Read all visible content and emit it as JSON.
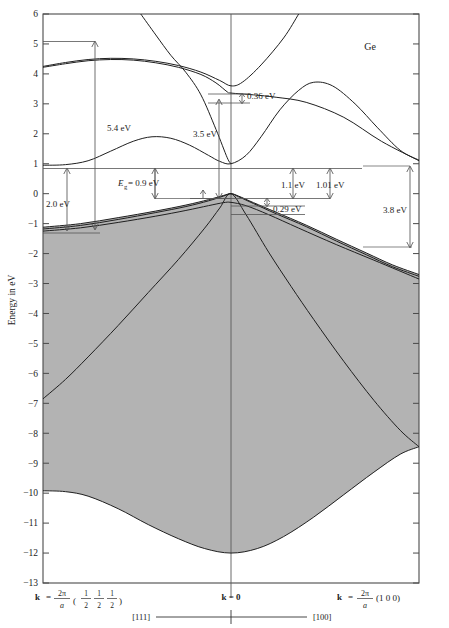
{
  "figure": {
    "material_label": "Ge",
    "y_axis_title": "Energy in eV",
    "y_ticks": [
      "6",
      "5",
      "4",
      "3",
      "2",
      "1",
      "0",
      "−1",
      "−2",
      "−3",
      "−4",
      "−5",
      "−6",
      "−7",
      "−8",
      "−9",
      "−10",
      "−11",
      "−12",
      "−13"
    ],
    "k_left_label_k": "k",
    "k_left_label_eq": "=",
    "k_left_num": "2π",
    "k_left_den": "a",
    "k_left_paren_open": "(",
    "k_left_paren_close": ")",
    "k_left_fracs": [
      {
        "num": "1",
        "den": "2"
      },
      {
        "num": "1",
        "den": "2"
      },
      {
        "num": "1",
        "den": "2"
      }
    ],
    "k_center_label": "k = 0",
    "k_right_label_k": "k",
    "k_right_label_eq": "=",
    "k_right_num": "2π",
    "k_right_den": "a",
    "k_right_tail": "(1 0 0)",
    "direction_left": "[111]",
    "direction_right": "[100]"
  },
  "annotations": [
    {
      "id": "gap-5p4",
      "label": "5.4 eV"
    },
    {
      "id": "gap-2p0",
      "label": "2.0 eV"
    },
    {
      "id": "gap-eg",
      "label_italic": "E",
      "label_sub": "g",
      "label_rest": " = 0.9 eV"
    },
    {
      "id": "gap-3p5",
      "label": "3.5 eV"
    },
    {
      "id": "gap-0p36",
      "label": "0.36 eV"
    },
    {
      "id": "gap-1p1",
      "label": "1.1 eV"
    },
    {
      "id": "gap-1p01",
      "label": "1.01 eV"
    },
    {
      "id": "gap-0p29",
      "label": "0.29 eV"
    },
    {
      "id": "gap-3p8",
      "label": "3.8 eV"
    }
  ],
  "chart_data": {
    "type": "line",
    "xlabel": "k",
    "ylabel": "Energy in eV",
    "ylim": [
      -13,
      6
    ],
    "xlim": [
      0,
      1
    ],
    "grid": false,
    "legend": "none",
    "x_tick_labels": [
      "k = 2π/a (1/2 1/2 1/2)",
      "k = 0",
      "k = 2π/a (1 0 0)"
    ],
    "x_tick_positions": [
      0,
      0.5,
      1
    ],
    "direction_segments": [
      "[111]",
      "[100]"
    ],
    "shaded_region": "valence bands (filled states) shaded grey",
    "series": [
      {
        "name": "upper conduction band (L2' - Gamma15 - X)",
        "points": [
          [
            0.0,
            4.25
          ],
          [
            0.06,
            4.38
          ],
          [
            0.12,
            4.48
          ],
          [
            0.18,
            4.52
          ],
          [
            0.24,
            4.5
          ],
          [
            0.3,
            4.42
          ],
          [
            0.36,
            4.28
          ],
          [
            0.42,
            4.06
          ],
          [
            0.47,
            3.78
          ],
          [
            0.5,
            3.6
          ],
          [
            0.53,
            3.72
          ],
          [
            0.58,
            4.3
          ],
          [
            0.64,
            5.2
          ],
          [
            0.68,
            6.0
          ]
        ]
      },
      {
        "name": "upper conduction band 2 (split)",
        "points": [
          [
            0.0,
            4.22
          ],
          [
            0.06,
            4.34
          ],
          [
            0.12,
            4.44
          ],
          [
            0.18,
            4.48
          ],
          [
            0.24,
            4.46
          ],
          [
            0.3,
            4.37
          ],
          [
            0.36,
            4.22
          ],
          [
            0.42,
            3.98
          ],
          [
            0.46,
            3.7
          ],
          [
            0.49,
            3.4
          ],
          [
            0.5,
            3.36
          ],
          [
            0.56,
            3.3
          ],
          [
            0.62,
            3.22
          ],
          [
            0.7,
            3.05
          ],
          [
            0.8,
            2.55
          ],
          [
            0.9,
            1.75
          ],
          [
            1.0,
            1.1
          ]
        ]
      },
      {
        "name": "steep band descending to Gamma2'",
        "points": [
          [
            0.26,
            6.0
          ],
          [
            0.3,
            5.3
          ],
          [
            0.34,
            4.62
          ],
          [
            0.38,
            4.05
          ],
          [
            0.42,
            3.3
          ],
          [
            0.46,
            2.15
          ],
          [
            0.49,
            1.2
          ],
          [
            0.5,
            1.0
          ]
        ]
      },
      {
        "name": "lowest conduction band L1 - Gamma2' - X1",
        "points": [
          [
            0.0,
            0.95
          ],
          [
            0.06,
            0.97
          ],
          [
            0.12,
            1.1
          ],
          [
            0.18,
            1.42
          ],
          [
            0.24,
            1.75
          ],
          [
            0.29,
            1.9
          ],
          [
            0.34,
            1.85
          ],
          [
            0.39,
            1.62
          ],
          [
            0.44,
            1.28
          ],
          [
            0.47,
            1.08
          ],
          [
            0.5,
            1.0
          ],
          [
            0.54,
            1.28
          ],
          [
            0.58,
            1.9
          ],
          [
            0.63,
            2.8
          ],
          [
            0.68,
            3.45
          ],
          [
            0.72,
            3.72
          ],
          [
            0.77,
            3.6
          ],
          [
            0.83,
            3.0
          ],
          [
            0.89,
            2.2
          ],
          [
            0.95,
            1.45
          ],
          [
            1.0,
            1.12
          ]
        ]
      },
      {
        "name": "light hole valence band",
        "points": [
          [
            0.0,
            -1.12
          ],
          [
            0.1,
            -1.0
          ],
          [
            0.2,
            -0.8
          ],
          [
            0.3,
            -0.58
          ],
          [
            0.38,
            -0.38
          ],
          [
            0.44,
            -0.2
          ],
          [
            0.48,
            -0.06
          ],
          [
            0.5,
            0.0
          ],
          [
            0.52,
            -0.08
          ],
          [
            0.56,
            -0.3
          ],
          [
            0.62,
            -0.62
          ],
          [
            0.7,
            -1.05
          ],
          [
            0.78,
            -1.52
          ],
          [
            0.86,
            -1.98
          ],
          [
            0.93,
            -2.38
          ],
          [
            1.0,
            -2.7
          ]
        ]
      },
      {
        "name": "heavy hole valence band",
        "points": [
          [
            0.0,
            -1.18
          ],
          [
            0.1,
            -1.06
          ],
          [
            0.2,
            -0.86
          ],
          [
            0.3,
            -0.63
          ],
          [
            0.38,
            -0.43
          ],
          [
            0.44,
            -0.24
          ],
          [
            0.48,
            -0.08
          ],
          [
            0.5,
            0.0
          ],
          [
            0.52,
            -0.1
          ],
          [
            0.56,
            -0.33
          ],
          [
            0.62,
            -0.67
          ],
          [
            0.7,
            -1.1
          ],
          [
            0.78,
            -1.58
          ],
          [
            0.86,
            -2.04
          ],
          [
            0.93,
            -2.44
          ],
          [
            1.0,
            -2.76
          ]
        ]
      },
      {
        "name": "split-off valence band",
        "points": [
          [
            0.0,
            -1.25
          ],
          [
            0.1,
            -1.14
          ],
          [
            0.2,
            -0.96
          ],
          [
            0.3,
            -0.75
          ],
          [
            0.38,
            -0.56
          ],
          [
            0.44,
            -0.4
          ],
          [
            0.48,
            -0.3
          ],
          [
            0.5,
            -0.29
          ],
          [
            0.54,
            -0.4
          ],
          [
            0.6,
            -0.7
          ],
          [
            0.68,
            -1.15
          ],
          [
            0.78,
            -1.7
          ],
          [
            0.88,
            -2.22
          ],
          [
            1.0,
            -2.85
          ]
        ]
      },
      {
        "name": "second valence band (L1 - Gamma25' - X4)",
        "points": [
          [
            0.0,
            -6.85
          ],
          [
            0.06,
            -6.2
          ],
          [
            0.12,
            -5.45
          ],
          [
            0.2,
            -4.4
          ],
          [
            0.28,
            -3.3
          ],
          [
            0.36,
            -2.2
          ],
          [
            0.43,
            -1.15
          ],
          [
            0.47,
            -0.48
          ],
          [
            0.5,
            0.0
          ],
          [
            0.54,
            -0.7
          ],
          [
            0.6,
            -1.95
          ],
          [
            0.66,
            -3.1
          ],
          [
            0.72,
            -4.2
          ],
          [
            0.8,
            -5.6
          ],
          [
            0.88,
            -6.9
          ],
          [
            0.95,
            -7.9
          ],
          [
            1.0,
            -8.45
          ]
        ]
      },
      {
        "name": "lowest valence band L1 - Gamma1 - X1",
        "points": [
          [
            0.0,
            -9.92
          ],
          [
            0.06,
            -9.95
          ],
          [
            0.12,
            -10.1
          ],
          [
            0.2,
            -10.52
          ],
          [
            0.28,
            -11.05
          ],
          [
            0.36,
            -11.52
          ],
          [
            0.43,
            -11.85
          ],
          [
            0.5,
            -12.0
          ],
          [
            0.57,
            -11.85
          ],
          [
            0.64,
            -11.45
          ],
          [
            0.72,
            -10.8
          ],
          [
            0.8,
            -10.05
          ],
          [
            0.88,
            -9.3
          ],
          [
            0.95,
            -8.7
          ],
          [
            1.0,
            -8.45
          ]
        ]
      }
    ],
    "annotated_gaps": [
      {
        "label": "5.4 eV",
        "from": 4.25,
        "to": -1.15,
        "at_k": "L"
      },
      {
        "label": "2.0 eV",
        "from": 0.95,
        "to": -1.05,
        "at_k": "L"
      },
      {
        "label": "Eg = 0.9 eV",
        "from": 1.0,
        "to": 0.0,
        "at_k": "L to Gamma"
      },
      {
        "label": "3.5 eV",
        "from": 3.36,
        "to": 0.0,
        "at_k": "Gamma"
      },
      {
        "label": "0.36 eV",
        "from": 3.6,
        "to": 3.3,
        "at_k": "Gamma"
      },
      {
        "label": "1.1 eV",
        "from": 1.0,
        "to": -0.05,
        "at_k": "Gamma"
      },
      {
        "label": "1.01 eV",
        "from": 1.0,
        "to": 0.0,
        "at_k": "Gamma"
      },
      {
        "label": "0.29 eV",
        "from": 0.0,
        "to": -0.29,
        "at_k": "Gamma"
      },
      {
        "label": "3.8 eV",
        "from": 1.1,
        "to": -2.72,
        "at_k": "X"
      }
    ]
  }
}
